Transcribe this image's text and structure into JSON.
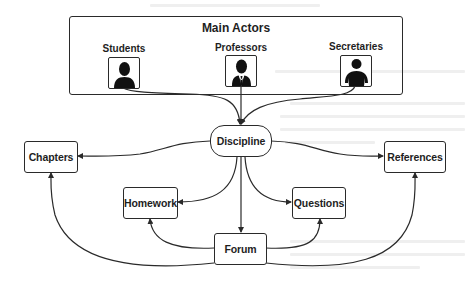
{
  "diagram": {
    "actors_group": {
      "title": "Main Actors",
      "actors": [
        {
          "label": "Students",
          "icon": "student-person-icon"
        },
        {
          "label": "Professors",
          "icon": "professor-person-with-tie-icon"
        },
        {
          "label": "Secretaries",
          "icon": "secretary-person-icon"
        }
      ]
    },
    "nodes": {
      "discipline": "Discipline",
      "chapters": "Chapters",
      "references": "References",
      "homework": "Homework",
      "questions": "Questions",
      "forum": "Forum"
    },
    "edges": [
      {
        "from": "Students",
        "to": "Discipline"
      },
      {
        "from": "Professors",
        "to": "Discipline"
      },
      {
        "from": "Secretaries",
        "to": "Discipline"
      },
      {
        "from": "Discipline",
        "to": "Chapters"
      },
      {
        "from": "Discipline",
        "to": "References"
      },
      {
        "from": "Discipline",
        "to": "Homework"
      },
      {
        "from": "Discipline",
        "to": "Questions"
      },
      {
        "from": "Discipline",
        "to": "Forum"
      },
      {
        "from": "Forum",
        "to": "Homework"
      },
      {
        "from": "Forum",
        "to": "Questions"
      },
      {
        "from": "Forum",
        "to": "Chapters"
      },
      {
        "from": "Forum",
        "to": "References"
      }
    ],
    "colors": {
      "line": "#2a2a2a",
      "text": "#1e1e1e",
      "background": "#ffffff"
    }
  }
}
